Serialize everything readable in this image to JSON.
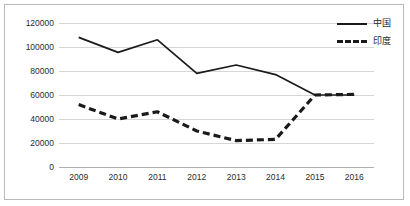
{
  "chart_data": {
    "type": "line",
    "title": "",
    "subtitle": "",
    "xlabel": "",
    "ylabel": "",
    "categories": [
      "2009",
      "2010",
      "2011",
      "2012",
      "2013",
      "2014",
      "2015",
      "2016"
    ],
    "series": [
      {
        "name": "中国",
        "style": "solid",
        "color": "#1a1a1a",
        "values": [
          108000,
          95500,
          106000,
          78000,
          85000,
          77000,
          60000,
          60000
        ]
      },
      {
        "name": "印度",
        "style": "dashed",
        "color": "#1a1a1a",
        "values": [
          52000,
          40000,
          46000,
          30000,
          22000,
          23000,
          60000,
          60500
        ]
      }
    ],
    "ylim": [
      0,
      120000
    ],
    "ytick_labels": [
      "0",
      "20000",
      "40000",
      "60000",
      "80000",
      "100000",
      "120000"
    ],
    "ytick_values": [
      0,
      20000,
      40000,
      60000,
      80000,
      100000,
      120000
    ],
    "grid": true,
    "grid_axis": "y",
    "legend": {
      "position": "top-right",
      "entries": [
        {
          "label": "中国",
          "style": "solid"
        },
        {
          "label": "印度",
          "style": "dashed"
        }
      ]
    },
    "colors": {
      "gridline": "#d6d6d6",
      "axis": "#b0b0b0",
      "border": "#b9b9b9",
      "series": "#1a1a1a",
      "background": "#ffffff",
      "tick_text": "#2b2b2b"
    }
  }
}
